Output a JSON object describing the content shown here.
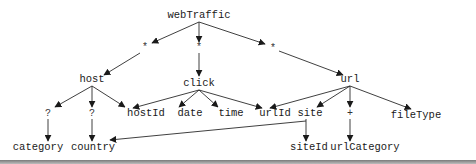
{
  "diagram": {
    "title": "webTraffic",
    "colors": {
      "edge": "#2a2a2a",
      "text": "#1a1a1a",
      "rule": "#7a7a7a",
      "background": "#ffffff"
    },
    "nodes": {
      "root": {
        "label": "webTraffic",
        "x": 199,
        "y": 18
      },
      "star_host": {
        "label": "*",
        "x": 145,
        "y": 50
      },
      "star_click": {
        "label": "*",
        "x": 199,
        "y": 50
      },
      "star_url": {
        "label": "*",
        "x": 273,
        "y": 51
      },
      "host": {
        "label": "host",
        "x": 92,
        "y": 82
      },
      "click": {
        "label": "click",
        "x": 199,
        "y": 86
      },
      "url": {
        "label": "url",
        "x": 350,
        "y": 82
      },
      "q_category": {
        "label": "?",
        "x": 48,
        "y": 116
      },
      "q_country": {
        "label": "?",
        "x": 92,
        "y": 116
      },
      "hostId": {
        "label": "hostId",
        "x": 146,
        "y": 116
      },
      "date": {
        "label": "date",
        "x": 190,
        "y": 116
      },
      "time": {
        "label": "time",
        "x": 231,
        "y": 116
      },
      "urlId": {
        "label": "urlId",
        "x": 275,
        "y": 116
      },
      "site": {
        "label": "site",
        "x": 310,
        "y": 116
      },
      "plus_urlCategory": {
        "label": "+",
        "x": 350,
        "y": 116
      },
      "fileType": {
        "label": "fileType",
        "x": 416,
        "y": 118
      },
      "category": {
        "label": "category",
        "x": 38,
        "y": 150
      },
      "country": {
        "label": "country",
        "x": 93,
        "y": 150
      },
      "siteId": {
        "label": "siteId",
        "x": 309,
        "y": 150
      },
      "urlCategory": {
        "label": "urlCategory",
        "x": 365,
        "y": 150
      }
    },
    "edges": [
      {
        "from": "root",
        "to": "star_host",
        "path": "M199,22 L152,43"
      },
      {
        "from": "star_host",
        "to": "host",
        "path": "M140,53 L104,75"
      },
      {
        "from": "root",
        "to": "star_click",
        "path": "M199,22 L199,42"
      },
      {
        "from": "star_click",
        "to": "click",
        "path": "M199,53 L199,76"
      },
      {
        "from": "root",
        "to": "star_url",
        "path": "M199,22 L265,44"
      },
      {
        "from": "star_url",
        "to": "url",
        "path": "M279,51 L343,75"
      },
      {
        "from": "host",
        "to": "q_category",
        "path": "M92,86 L55,107"
      },
      {
        "from": "host",
        "to": "q_country",
        "path": "M92,86 L92,107"
      },
      {
        "from": "host",
        "to": "hostId",
        "path": "M92,86 L125,107"
      },
      {
        "from": "click",
        "to": "hostId",
        "path": "M199,90 L133,108"
      },
      {
        "from": "click",
        "to": "date",
        "path": "M199,90 L179,107"
      },
      {
        "from": "click",
        "to": "time",
        "path": "M199,90 L218,107"
      },
      {
        "from": "click",
        "to": "urlId",
        "path": "M199,90 L262,108"
      },
      {
        "from": "url",
        "to": "urlId",
        "path": "M350,86 L270,108"
      },
      {
        "from": "url",
        "to": "site",
        "path": "M350,86 L317,107"
      },
      {
        "from": "url",
        "to": "plus_urlCategory",
        "path": "M350,86 L350,107"
      },
      {
        "from": "url",
        "to": "fileType",
        "path": "M350,86 L411,109"
      },
      {
        "from": "q_category",
        "to": "category",
        "path": "M48,119 L48,141"
      },
      {
        "from": "q_country",
        "to": "country",
        "path": "M92,119 L92,141"
      },
      {
        "from": "site",
        "to": "siteId",
        "path": "M306,119 L306,141"
      },
      {
        "from": "site",
        "to": "country",
        "path": "M306,121 L110,140"
      },
      {
        "from": "plus_urlCategory",
        "to": "urlCategory",
        "path": "M350,119 L350,141"
      }
    ]
  }
}
